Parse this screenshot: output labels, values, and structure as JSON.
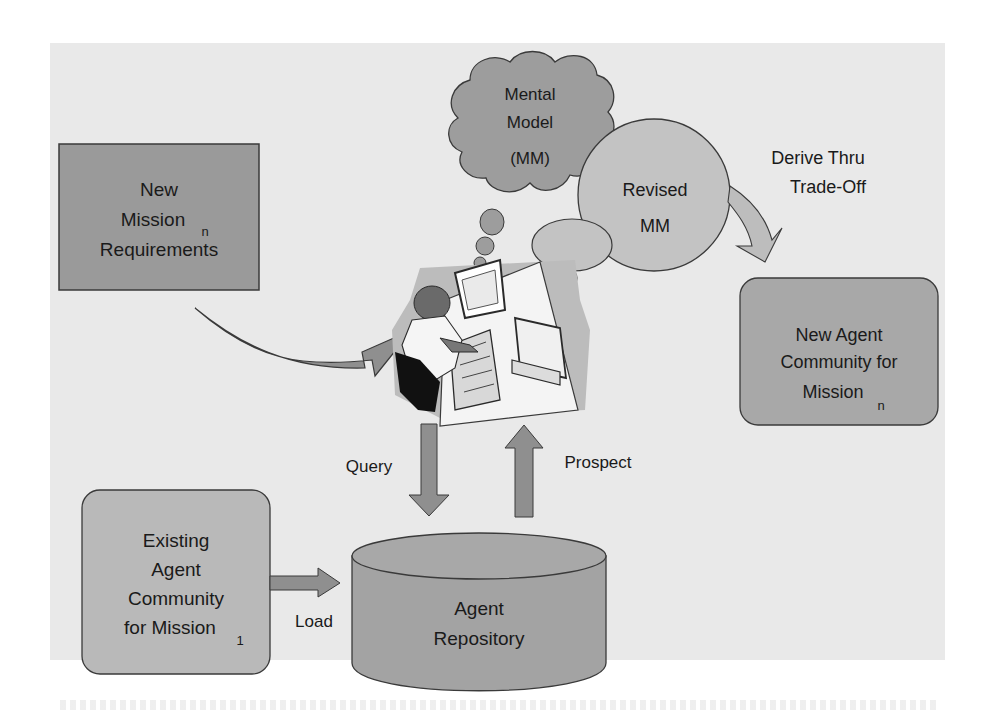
{
  "diagram": {
    "nodes": {
      "new_mission": {
        "line1": "New",
        "line2": "Mission",
        "sub": "n",
        "line3": "Requirements"
      },
      "mental_model": {
        "line1": "Mental",
        "line2": "Model",
        "line3": "(MM)"
      },
      "revised_mm": {
        "line1": "Revised",
        "line2": "MM"
      },
      "new_community": {
        "line1": "New Agent",
        "line2": "Community for",
        "line3": "Mission",
        "sub": "n"
      },
      "existing_community": {
        "line1": "Existing",
        "line2": "Agent",
        "line3": "Community",
        "line4": "for Mission",
        "sub": "1"
      },
      "repository": {
        "line1": "Agent",
        "line2": "Repository"
      },
      "user": {
        "label": "person-at-computer"
      }
    },
    "edges": {
      "derive": {
        "line1": "Derive Thru",
        "line2": "Trade-Off"
      },
      "query": "Query",
      "prospect": "Prospect",
      "load": "Load"
    },
    "colors": {
      "panel": "#e9e9e9",
      "box_dark": "#9a9a9a",
      "box_light": "#b9b9b9",
      "cloud": "#9d9d9d",
      "bubble": "#c3c3c3",
      "arrow": "#8f8f8f",
      "arrow_light": "#bdbdbd",
      "stroke": "#3a3a3a"
    }
  }
}
